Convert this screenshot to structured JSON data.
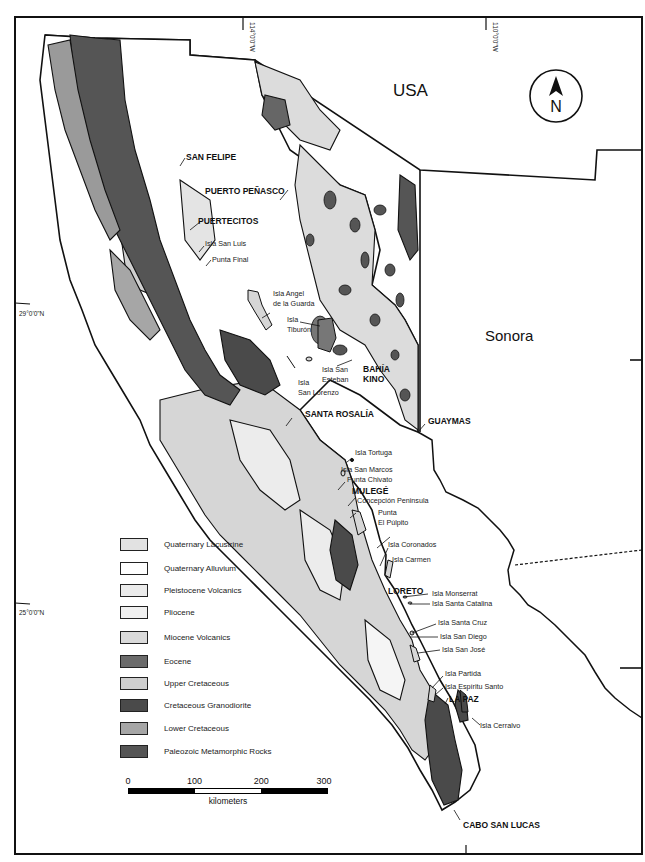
{
  "map": {
    "countries": {
      "usa": "USA",
      "sonora": "Sonora"
    },
    "north_arrow": {
      "letter": "N"
    },
    "graticule": {
      "lon": [
        "114°0'0\"W",
        "110°0'0\"W"
      ],
      "lat": [
        "29°0'0\"N",
        "25°0'0\"N"
      ]
    },
    "cities": {
      "san_felipe": "SAN FELIPE",
      "puerto_penasco": "PUERTO PEÑASCO",
      "puertecitos": "PUERTECITOS",
      "bahia": "BAHÍA",
      "kino": "KINO",
      "santa_rosalia": "SANTA ROSALÍA",
      "guaymas": "GUAYMAS",
      "mulege": "MULEGÉ",
      "loreto": "LORETO",
      "la_paz": "LA PAZ",
      "cabo_san_lucas": "CABO SAN LUCAS"
    },
    "places": {
      "isla_san_luis": "Isla San Luis",
      "punta_final": "Punta Final",
      "isla_angel_1": "Isla Angel",
      "isla_angel_2": "de la Guarda",
      "isla_tiburon_1": "Isla",
      "isla_tiburon_2": "Tiburón",
      "isla_san_esteban_1": "Isla San",
      "isla_san_esteban_2": "Esteban",
      "isla_san_lorenzo_1": "Isla",
      "isla_san_lorenzo_2": "San Lorenzo",
      "isla_tortuga": "Isla Tortuga",
      "isla_san_marcos": "Isla San Marcos",
      "punta_chivato": "Punta Chivato",
      "concepcion": "Concepción Peninsula",
      "punta_pulpito_1": "Punta",
      "punta_pulpito_2": "El Púlpito",
      "isla_coronados": "Isla Coronados",
      "isla_carmen": "Isla Carmen",
      "isla_monserrat": "Isla Monserrat",
      "isla_santa_catalina": "Isla Santa Catalina",
      "isla_santa_cruz": "Isla Santa Cruz",
      "isla_san_diego": "Isla San Diego",
      "isla_san_jose": "Isla San José",
      "isla_partida": "Isla Partida",
      "isla_espiritu_santo": "Isla Espíritu Santo",
      "isla_cerralvo": "Isla Cerralvo"
    }
  },
  "legend": {
    "items": [
      {
        "label": "Quaternary Lacustrine",
        "color": "#e2e2e2"
      },
      {
        "label": "Quaternary Alluvium",
        "color": "#ffffff"
      },
      {
        "label": "Pleistocene Volcanics",
        "color": "#ebebeb"
      },
      {
        "label": "Pliocene",
        "color": "#f0f0f0"
      },
      {
        "label": "Miocene Volcanics",
        "color": "#dadada"
      },
      {
        "label": "Eocene",
        "color": "#6b6b6b"
      },
      {
        "label": "Upper Cretaceous",
        "color": "#cfcfcf"
      },
      {
        "label": "Cretaceous Granodiorite",
        "color": "#4a4a4a"
      },
      {
        "label": "Lower Cretaceous",
        "color": "#a6a6a6"
      },
      {
        "label": "Paleozoic Metamorphic Rocks",
        "color": "#555555"
      }
    ]
  },
  "scalebar": {
    "ticks": [
      "0",
      "100",
      "200",
      "300"
    ],
    "unit": "kilometers"
  }
}
